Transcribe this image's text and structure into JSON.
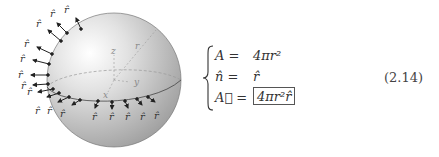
{
  "figure": {
    "arrow_label": "r̂",
    "axis_labels": {
      "z": "z",
      "r": "r",
      "y": "y",
      "x": "x"
    },
    "colors": {
      "sphere_light": "#ffffff",
      "sphere_dark": "#a6a6a6",
      "arrow": "#222222",
      "dashed": "#9a9a9a",
      "axis_text": "#8a8a8a"
    }
  },
  "equation": {
    "rows": [
      {
        "lhs": "A =",
        "rhs": "4πr²"
      },
      {
        "lhs": "n̂ =",
        "rhs": "r̂"
      },
      {
        "lhs": "A⃗ =",
        "rhs": "4πr²r̂",
        "boxed": true
      }
    ],
    "number": "(2.14)"
  }
}
